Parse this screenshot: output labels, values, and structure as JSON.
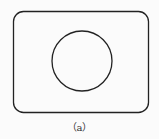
{
  "diagram": {
    "caption": "（a）",
    "shapes": [
      {
        "type": "rounded-rect",
        "x": 13,
        "y": 11,
        "width": 135,
        "height": 101,
        "rx": 10
      },
      {
        "type": "circle",
        "cx": 82,
        "cy": 61,
        "r": 30
      }
    ],
    "stroke_color": "#222222",
    "background_color": "#fbfbfb"
  }
}
